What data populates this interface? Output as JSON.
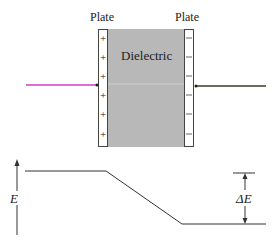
{
  "figure": {
    "labels": {
      "left_plate": "Plate",
      "right_plate": "Plate",
      "dielectric": "Dielectric",
      "energy_axis": "E",
      "energy_difference": "ΔE"
    },
    "left_plate_charges": [
      "+",
      "+",
      "+",
      "+",
      "+",
      "+"
    ],
    "right_plate_charges": [
      "−",
      "−",
      "−",
      "−",
      "−",
      "−"
    ],
    "colors": {
      "dielectric_fill": "#b8b8b8",
      "plate_fill": "#ffffff",
      "left_wire": "#d23cc8",
      "right_wire": "#3a3a2a",
      "line": "#333333"
    },
    "energy_profile": {
      "description": "Energy high at left plate, decreases linearly across dielectric, low at right plate",
      "high_level_segment": "left",
      "low_level_segment": "right"
    }
  }
}
